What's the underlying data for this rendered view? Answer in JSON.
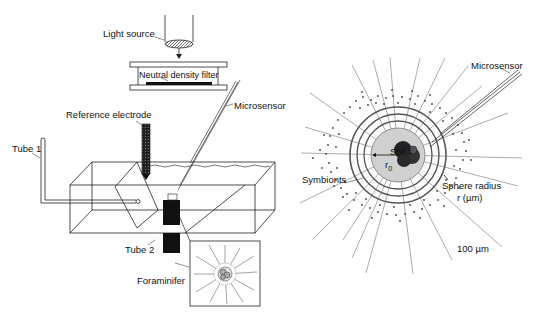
{
  "left_panel": {
    "labels": {
      "light_source": "Light source",
      "neutral_density_filter": "Neutral density filter",
      "microsensor": "Microsensor",
      "reference_electrode": "Reference electrode",
      "tube1": "Tube 1",
      "tube2": "Tube 2",
      "foraminifer": "Foraminifer"
    }
  },
  "right_panel": {
    "labels": {
      "microsensor": "Microsensor",
      "shell": "Shell",
      "r0": "r",
      "r0_sub": "0",
      "symbionts": "Symbionts",
      "sphere_radius": "Sphere radius",
      "sphere_radius_unit": "r (µm)",
      "scale": "100 µm"
    }
  }
}
